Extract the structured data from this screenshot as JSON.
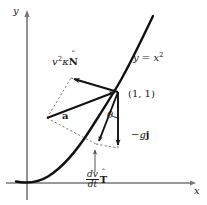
{
  "figure": {
    "background_color": "#ffffff",
    "ink_color": "#1a1a1a",
    "axes": {
      "x_label": "x",
      "y_label": "y",
      "x_axis_y_px": 183,
      "y_axis_x_px": 27
    },
    "curve": {
      "label": "y = x",
      "label_exponent": "2",
      "equation": "y = x^2",
      "type": "parabola"
    },
    "point": {
      "label": "(1, 1)",
      "x_px": 118,
      "y_px": 92
    },
    "angle": {
      "label": "θ"
    },
    "vectors": [
      {
        "name": "normal-component",
        "label_base": "v",
        "label_exponent": "2",
        "label_kappa": "κ",
        "label_vector": "N",
        "label_hat": "ˆ",
        "label_text": "v²κN̂",
        "style": "solid"
      },
      {
        "name": "acceleration",
        "label_text": "a",
        "style": "solid"
      },
      {
        "name": "gravity",
        "label_prefix": "−g",
        "label_vector": "j",
        "label_text": "−gj",
        "style": "solid"
      },
      {
        "name": "tangential-component",
        "label_numerator": "dv",
        "label_denominator": "dt",
        "label_vector": "T",
        "label_hat": "ˆ",
        "label_text": "(dv/dt)T̂",
        "style": "solid"
      }
    ]
  }
}
